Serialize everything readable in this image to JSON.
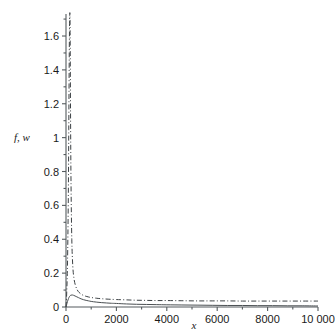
{
  "chart_data": {
    "type": "line",
    "title": "",
    "xlabel": "x",
    "ylabel": "f, w",
    "xlim": [
      0,
      10000
    ],
    "ylim": [
      0,
      1.73
    ],
    "grid": false,
    "legend": "none",
    "xticks": [
      0,
      2000,
      4000,
      6000,
      8000,
      10000
    ],
    "xticklabels": [
      "0",
      "2000",
      "4000",
      "6000",
      "8000",
      "10 000"
    ],
    "xminorticks": [
      1000,
      3000,
      5000,
      7000,
      9000
    ],
    "yticks": [
      0,
      0.2,
      0.4,
      0.6,
      0.8,
      1.0,
      1.2,
      1.4,
      1.6
    ],
    "yticklabels": [
      "0",
      "0.2",
      "0.4",
      "0.6",
      "0.8",
      "1",
      "1.2",
      "1.4",
      "1.6"
    ],
    "yminorticks": [
      0.1,
      0.3,
      0.5,
      0.7,
      0.9,
      1.1,
      1.3,
      1.5,
      1.7
    ],
    "series": [
      {
        "name": "f",
        "style": "solid",
        "color": "#4a4f52",
        "x": [
          0,
          40,
          80,
          120,
          160,
          200,
          250,
          300,
          360,
          430,
          500,
          600,
          700,
          800,
          900,
          1000,
          1200,
          1400,
          1600,
          1800,
          2000,
          2400,
          2800,
          3200,
          3600,
          4000,
          4600,
          5200,
          5800,
          6400,
          7000,
          7600,
          8200,
          8800,
          9400,
          10000
        ],
        "y": [
          0.0,
          0.022,
          0.042,
          0.057,
          0.066,
          0.07,
          0.071,
          0.069,
          0.065,
          0.06,
          0.055,
          0.048,
          0.043,
          0.039,
          0.036,
          0.033,
          0.029,
          0.026,
          0.024,
          0.022,
          0.021,
          0.018,
          0.016,
          0.015,
          0.014,
          0.013,
          0.012,
          0.011,
          0.01,
          0.009,
          0.009,
          0.008,
          0.008,
          0.007,
          0.007,
          0.006
        ]
      },
      {
        "name": "w",
        "style": "dash-dot",
        "color": "#3c4144",
        "x": [
          0,
          30,
          60,
          90,
          110,
          130,
          145,
          155,
          165,
          180,
          200,
          230,
          270,
          320,
          380,
          450,
          520,
          600,
          700,
          800,
          900,
          1000,
          1200,
          1400,
          1700,
          2000,
          2400,
          2800,
          3200,
          3600,
          4000,
          4600,
          5200,
          5800,
          6400,
          7000,
          7600,
          8200,
          8800,
          9400,
          10000
        ],
        "y": [
          0.0,
          0.09,
          0.26,
          0.62,
          1.05,
          1.5,
          1.7,
          1.73,
          1.6,
          1.15,
          0.72,
          0.4,
          0.24,
          0.165,
          0.125,
          0.1,
          0.086,
          0.076,
          0.068,
          0.063,
          0.059,
          0.056,
          0.052,
          0.049,
          0.046,
          0.044,
          0.042,
          0.04,
          0.039,
          0.038,
          0.038,
          0.037,
          0.036,
          0.036,
          0.036,
          0.035,
          0.035,
          0.035,
          0.035,
          0.035,
          0.035
        ]
      }
    ]
  }
}
